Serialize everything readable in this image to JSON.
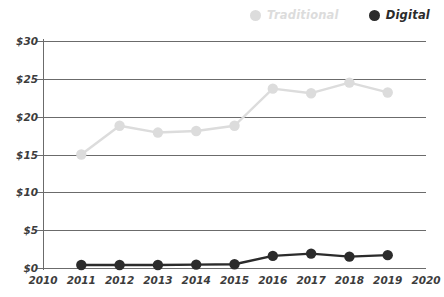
{
  "legend": {
    "position": "top-right",
    "items": [
      {
        "label": "Traditional",
        "color": "#dcdcdc",
        "marker": "legend-dot-traditional"
      },
      {
        "label": "Digital",
        "color": "#2b2b2b",
        "marker": "legend-dot-digital"
      }
    ]
  },
  "chart_data": {
    "type": "line",
    "title": "",
    "subtitle": "",
    "xlabel": "",
    "ylabel": "",
    "x": [
      2010,
      2011,
      2012,
      2013,
      2014,
      2015,
      2016,
      2017,
      2018,
      2019,
      2020
    ],
    "xtick_labels": [
      "2010",
      "2011",
      "2012",
      "2013",
      "2014",
      "2015",
      "2016",
      "2017",
      "2018",
      "2019",
      "2020"
    ],
    "xlim": [
      2010,
      2020
    ],
    "ytick_labels": [
      "$0",
      "$5",
      "$10",
      "$15",
      "$20",
      "$25",
      "$30"
    ],
    "ytick_values": [
      0,
      5,
      10,
      15,
      20,
      25,
      30
    ],
    "ylim": [
      0,
      30
    ],
    "grid": true,
    "grid_axis": "y",
    "legend_position": "top-right",
    "series": [
      {
        "name": "Traditional",
        "color": "#dcdcdc",
        "x": [
          2011,
          2012,
          2013,
          2014,
          2015,
          2016,
          2017,
          2018,
          2019
        ],
        "values": [
          15.0,
          18.8,
          17.9,
          18.1,
          18.8,
          23.7,
          23.1,
          24.5,
          23.2
        ]
      },
      {
        "name": "Digital",
        "color": "#2b2b2b",
        "x": [
          2011,
          2012,
          2013,
          2014,
          2015,
          2016,
          2017,
          2018,
          2019
        ],
        "values": [
          0.4,
          0.4,
          0.4,
          0.45,
          0.5,
          1.6,
          1.9,
          1.5,
          1.7
        ]
      }
    ]
  }
}
